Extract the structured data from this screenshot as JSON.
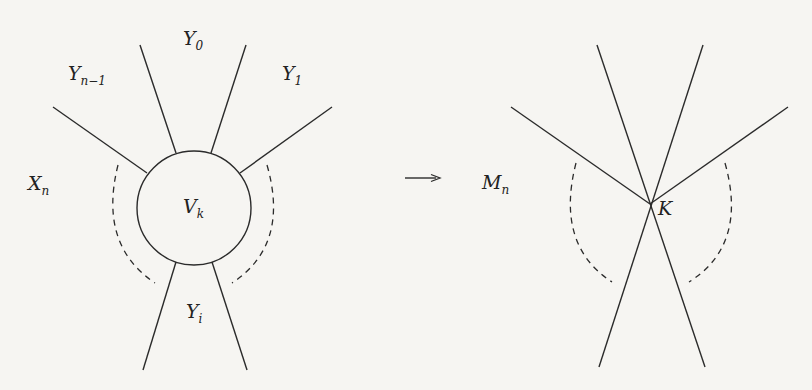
{
  "left_diagram": {
    "labels": {
      "y0": {
        "main": "Y",
        "sub": "0"
      },
      "yn1": {
        "main": "Y",
        "sub": "n−1"
      },
      "y1": {
        "main": "Y",
        "sub": "1"
      },
      "xn": {
        "main": "X",
        "sub": "n"
      },
      "vk": {
        "main": "V",
        "sub": "k"
      },
      "yi": {
        "main": "Y",
        "sub": "i"
      }
    }
  },
  "arrow": {
    "symbol": "→"
  },
  "right_diagram": {
    "labels": {
      "mn": {
        "main": "M",
        "sub": "n"
      },
      "k": {
        "main": "K"
      }
    }
  }
}
